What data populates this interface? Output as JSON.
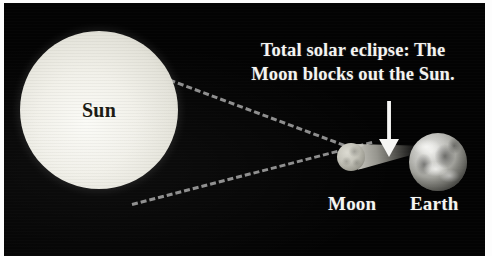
{
  "figure": {
    "kind": "solar-eclipse-diagram",
    "background_color": "#030303",
    "border_color": "#fdfdfd"
  },
  "caption": {
    "line1": "Total solar eclipse: The",
    "line2": "Moon blocks out the Sun.",
    "color": "#f4f4f1"
  },
  "bodies": {
    "sun": {
      "label": "Sun",
      "label_color": "#16160f",
      "body_color": "#f2f1ea"
    },
    "moon": {
      "label": "Moon",
      "label_color": "#f5f5f2",
      "body_color": "#c4c3b9"
    },
    "earth": {
      "label": "Earth",
      "label_color": "#f5f5f2",
      "body_color": "#b9b9b4"
    }
  },
  "annotations": {
    "arrow": "down-arrow-pointing-to-umbra",
    "arrow_color": "#f6f6f4",
    "ray_top": "sun-tangent-ray-upper",
    "ray_bottom": "sun-tangent-ray-lower",
    "ray_color": "#8d8d8d",
    "umbra": "moon-shadow-cone"
  }
}
